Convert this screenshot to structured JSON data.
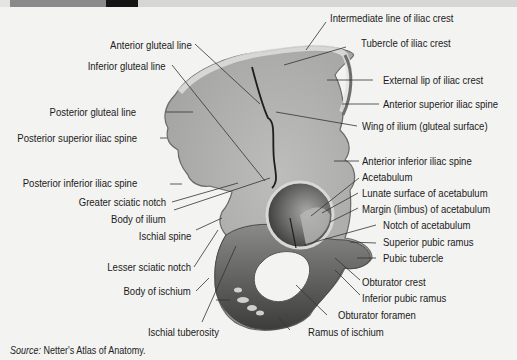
{
  "figure": {
    "labels_left": [
      {
        "id": "anterior-gluteal-line",
        "text": "Anterior gluteal line"
      },
      {
        "id": "inferior-gluteal-line",
        "text": "Inferior gluteal line"
      },
      {
        "id": "posterior-gluteal-line",
        "text": "Posterior gluteal line"
      },
      {
        "id": "posterior-superior-iliac-spine",
        "text": "Posterior superior iliac spine"
      },
      {
        "id": "posterior-inferior-iliac-spine",
        "text": "Posterior inferior iliac spine"
      },
      {
        "id": "greater-sciatic-notch",
        "text": "Greater sciatic notch"
      },
      {
        "id": "body-of-ilium",
        "text": "Body of ilium"
      },
      {
        "id": "ischial-spine",
        "text": "Ischial spine"
      },
      {
        "id": "lesser-sciatic-notch",
        "text": "Lesser sciatic notch"
      },
      {
        "id": "body-of-ischium",
        "text": "Body of ischium"
      },
      {
        "id": "ischial-tuberosity",
        "text": "Ischial tuberosity"
      }
    ],
    "labels_right": [
      {
        "id": "intermediate-line-of-iliac-crest",
        "text": "Intermediate line of iliac crest"
      },
      {
        "id": "tubercle-of-iliac-crest",
        "text": "Tubercle of iliac crest"
      },
      {
        "id": "external-lip-of-iliac-crest",
        "text": "External lip of iliac crest"
      },
      {
        "id": "anterior-superior-iliac-spine",
        "text": "Anterior superior iliac spine"
      },
      {
        "id": "wing-of-ilium",
        "text": "Wing of ilium (gluteal surface)"
      },
      {
        "id": "anterior-inferior-iliac-spine",
        "text": "Anterior inferior iliac spine"
      },
      {
        "id": "acetabulum",
        "text": "Acetabulum"
      },
      {
        "id": "lunate-surface",
        "text": "Lunate surface of acetabulum"
      },
      {
        "id": "margin-of-acetabulum",
        "text": "Margin (limbus) of acetabulum"
      },
      {
        "id": "notch-of-acetabulum",
        "text": "Notch of acetabulum"
      },
      {
        "id": "superior-pubic-ramus",
        "text": "Superior pubic ramus"
      },
      {
        "id": "pubic-tubercle",
        "text": "Pubic tubercle"
      },
      {
        "id": "obturator-crest",
        "text": "Obturator crest"
      },
      {
        "id": "inferior-pubic-ramus",
        "text": "Inferior pubic ramus"
      },
      {
        "id": "obturator-foramen",
        "text": "Obturator foramen"
      },
      {
        "id": "ramus-of-ischium",
        "text": "Ramus of ischium"
      }
    ]
  },
  "source": {
    "prefix": "Source:",
    "text": " Netter's Atlas of Anatomy."
  },
  "colors": {
    "background": "#f3f3f1",
    "bone_light": "#c9c9c7",
    "bone_mid": "#9d9d9b",
    "bone_dark": "#4a4a48",
    "leader_line": "#333333"
  }
}
